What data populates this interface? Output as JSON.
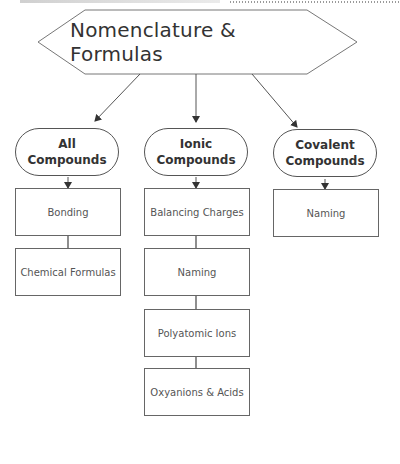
{
  "title": "Nomenclature & Formulas",
  "columns": [
    {
      "header_line1": "All",
      "header_line2": "Compounds",
      "items": [
        "Bonding",
        "Chemical Formulas"
      ]
    },
    {
      "header_line1": "Ionic",
      "header_line2": "Compounds",
      "items": [
        "Balancing Charges",
        "Naming",
        "Polyatomic Ions",
        "Oxyanions & Acids"
      ]
    },
    {
      "header_line1": "Covalent",
      "header_line2": "Compounds",
      "items": [
        "Naming"
      ]
    }
  ]
}
